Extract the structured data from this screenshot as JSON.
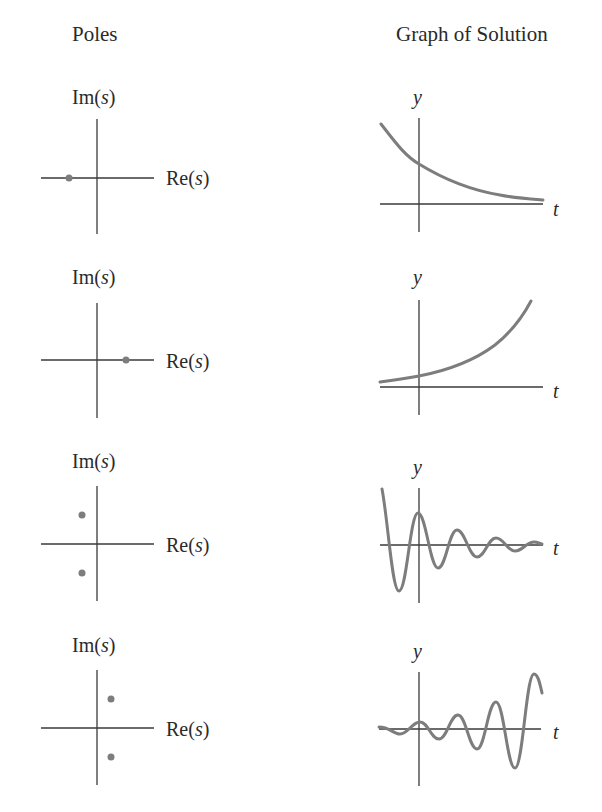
{
  "headers": {
    "poles": "Poles",
    "graph": "Graph of Solution"
  },
  "axis_labels": {
    "im_prefix": "Im(",
    "re_prefix": "Re(",
    "var_s": "s",
    "close": ")",
    "y": "y",
    "t": "t"
  },
  "colors": {
    "axis": "#3a3a3a",
    "curve": "#7d7d7d",
    "pole": "#7d7d7d"
  },
  "rows": [
    {
      "id": "real-negative",
      "poles": [
        {
          "re": -1,
          "im": 0
        }
      ],
      "solution": "exponential decay"
    },
    {
      "id": "real-positive",
      "poles": [
        {
          "re": 1,
          "im": 0
        }
      ],
      "solution": "exponential growth"
    },
    {
      "id": "complex-left",
      "poles": [
        {
          "re": -0.5,
          "im": 1
        },
        {
          "re": -0.5,
          "im": -1
        }
      ],
      "solution": "damped oscillation"
    },
    {
      "id": "complex-right",
      "poles": [
        {
          "re": 0.5,
          "im": 1
        },
        {
          "re": 0.5,
          "im": -1
        }
      ],
      "solution": "growing oscillation"
    }
  ]
}
